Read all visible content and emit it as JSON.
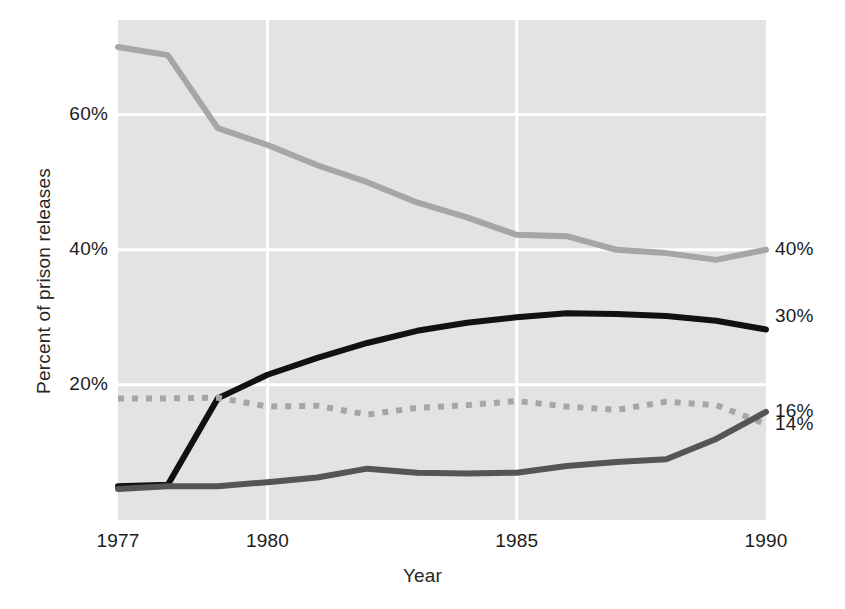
{
  "chart_data": {
    "type": "line",
    "title": "",
    "xlabel": "Year",
    "ylabel": "Percent of prison releases",
    "xlim": [
      1977,
      1990
    ],
    "ylim": [
      0,
      74
    ],
    "grid": true,
    "legend_position": "right-end-labels",
    "x_tick_labels": [
      "1977",
      "1980",
      "1985",
      "1990"
    ],
    "x_tick_values": [
      1977,
      1980,
      1985,
      1990
    ],
    "y_tick_labels": [
      "20%",
      "40%",
      "60%"
    ],
    "y_tick_values": [
      20,
      40,
      60
    ],
    "right_end_labels": [
      {
        "text": "40%",
        "value": 40,
        "series": "light-gray-line"
      },
      {
        "text": "30%",
        "value": 30,
        "series": "black-line"
      },
      {
        "text": "16%",
        "value": 16,
        "series": "dark-gray-line"
      },
      {
        "text": "14%",
        "value": 14,
        "series": "dotted-gray-line"
      }
    ],
    "x": [
      1977,
      1978,
      1979,
      1980,
      1981,
      1982,
      1983,
      1984,
      1985,
      1986,
      1987,
      1988,
      1989,
      1990
    ],
    "series": [
      {
        "name": "light-gray-line",
        "style": "solid",
        "color": "#a6a6a6",
        "width": 6,
        "end_label": "40%",
        "values": [
          70.0,
          68.8,
          58.0,
          55.5,
          52.5,
          50.0,
          47.0,
          44.8,
          42.2,
          42.0,
          40.0,
          39.5,
          38.5,
          40.0
        ]
      },
      {
        "name": "black-line",
        "style": "solid",
        "color": "#111111",
        "width": 6,
        "end_label": "30%",
        "values": [
          5.0,
          5.2,
          18.0,
          21.5,
          24.0,
          26.2,
          28.0,
          29.2,
          30.0,
          30.6,
          30.5,
          30.2,
          29.5,
          28.2
        ]
      },
      {
        "name": "dotted-gray-line",
        "style": "dotted",
        "color": "#a6a6a6",
        "width": 6,
        "end_label": "14%",
        "values": [
          18.0,
          18.0,
          18.1,
          16.8,
          16.9,
          15.6,
          16.6,
          17.0,
          17.6,
          16.8,
          16.3,
          17.5,
          17.0,
          14.2
        ]
      },
      {
        "name": "dark-gray-line",
        "style": "solid",
        "color": "#555555",
        "width": 6,
        "end_label": "16%",
        "values": [
          4.6,
          5.0,
          5.0,
          5.6,
          6.3,
          7.6,
          7.0,
          6.9,
          7.0,
          8.0,
          8.6,
          9.0,
          12.0,
          16.0
        ]
      }
    ]
  }
}
